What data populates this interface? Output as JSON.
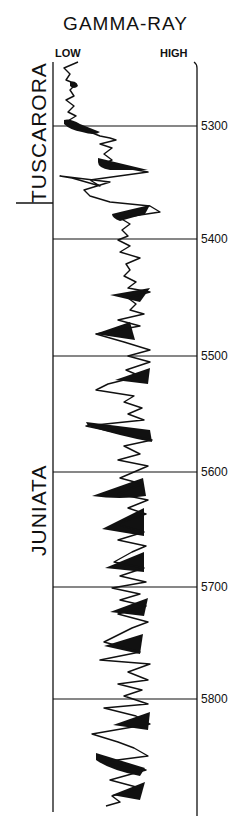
{
  "title": "GAMMA-RAY",
  "scale": {
    "low_label": "LOW",
    "high_label": "HIGH"
  },
  "formations": [
    {
      "name": "TUSCARORA",
      "top_depth": null,
      "base_depth": 5368
    },
    {
      "name": "JUNIATA",
      "top_depth": 5368,
      "base_depth": null
    }
  ],
  "depth_markers": [
    {
      "label": "5300",
      "y": 126
    },
    {
      "label": "5400",
      "y": 239
    },
    {
      "label": "5500",
      "y": 356
    },
    {
      "label": "5600",
      "y": 472
    },
    {
      "label": "5700",
      "y": 587
    },
    {
      "label": "5800",
      "y": 699
    }
  ],
  "colors": {
    "ink": "#111111",
    "background": "#ffffff"
  }
}
